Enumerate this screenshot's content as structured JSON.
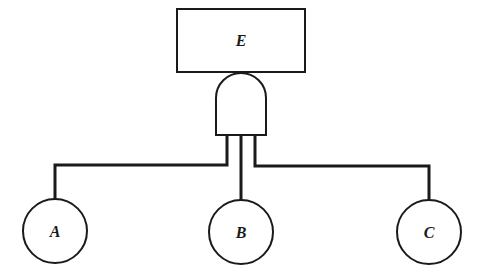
{
  "diagram": {
    "type": "fault-tree",
    "top_event": {
      "label": "E",
      "shape": "rectangle"
    },
    "gate": {
      "type": "AND",
      "shape": "and-gate-icon"
    },
    "basic_events": [
      {
        "label": "A",
        "shape": "circle"
      },
      {
        "label": "B",
        "shape": "circle"
      },
      {
        "label": "C",
        "shape": "circle"
      }
    ],
    "edges": [
      {
        "from": "gate",
        "to": "E"
      },
      {
        "from": "A",
        "to": "gate"
      },
      {
        "from": "B",
        "to": "gate"
      },
      {
        "from": "C",
        "to": "gate"
      }
    ],
    "colors": {
      "stroke": "#1a1a1a",
      "background": "#ffffff"
    }
  }
}
